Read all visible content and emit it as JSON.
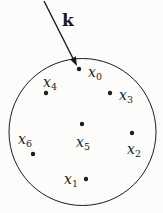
{
  "diagram": {
    "background": "#fcfcfa",
    "ink": "#1c1c1c",
    "arrow_label": "k",
    "k_label_pos": {
      "x": 62,
      "y": 26
    },
    "circle": {
      "cx": 82.5,
      "cy": 132,
      "r": 73.5
    },
    "arrow": {
      "x1": 44,
      "y1": 1,
      "x2": 73.5,
      "y2": 59.5,
      "head_points": "77,66 70.1,59.5 75.9,56.3"
    },
    "points": [
      {
        "id": "x0",
        "base": "x",
        "sub": "0",
        "dot": {
          "x": 79,
          "y": 69,
          "r": 2.2
        },
        "label": {
          "x": 88,
          "y": 77
        }
      },
      {
        "id": "x4",
        "base": "x",
        "sub": "4",
        "dot": {
          "x": 46,
          "y": 93,
          "r": 2.2
        },
        "label": {
          "x": 43,
          "y": 87
        }
      },
      {
        "id": "x3",
        "base": "x",
        "sub": "3",
        "dot": {
          "x": 110,
          "y": 93,
          "r": 2.2
        },
        "label": {
          "x": 119,
          "y": 100
        }
      },
      {
        "id": "x5",
        "base": "x",
        "sub": "5",
        "dot": {
          "x": 82,
          "y": 124,
          "r": 2.2
        },
        "label": {
          "x": 76,
          "y": 147
        }
      },
      {
        "id": "x2",
        "base": "x",
        "sub": "2",
        "dot": {
          "x": 132,
          "y": 133,
          "r": 2.2
        },
        "label": {
          "x": 127,
          "y": 154
        }
      },
      {
        "id": "x6",
        "base": "x",
        "sub": "6",
        "dot": {
          "x": 33,
          "y": 154,
          "r": 2.2
        },
        "label": {
          "x": 18,
          "y": 144
        }
      },
      {
        "id": "x1",
        "base": "x",
        "sub": "1",
        "dot": {
          "x": 86,
          "y": 179,
          "r": 2.2
        },
        "label": {
          "x": 64,
          "y": 184
        }
      }
    ]
  }
}
